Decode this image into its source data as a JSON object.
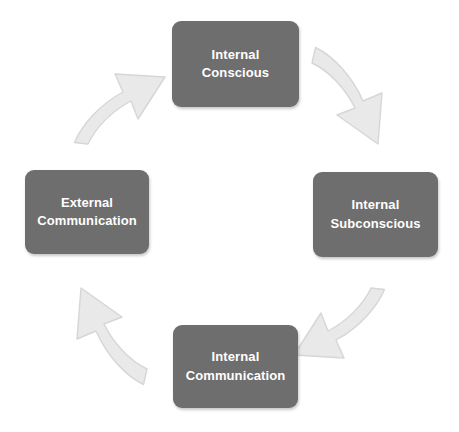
{
  "diagram": {
    "type": "cycle",
    "title": "",
    "background_color": "#ffffff",
    "node_fill_color": "#6e6e6e",
    "node_text_color": "#ffffff",
    "arrow_fill_color": "#e9e9e9",
    "arrow_outline_color": "#d2d2d2",
    "nodes": [
      {
        "id": "internal-conscious",
        "label": "Internal\nConscious",
        "line1": "Internal",
        "line2": "Conscious",
        "position": "top"
      },
      {
        "id": "internal-subconscious",
        "label": "Internal\nSubconscious",
        "line1": "Internal",
        "line2": "Subconscious",
        "position": "right"
      },
      {
        "id": "internal-communication",
        "label": "Internal\nCommunication",
        "line1": "Internal",
        "line2": "Communication",
        "position": "bottom"
      },
      {
        "id": "external-communication",
        "label": "External\nCommunication",
        "line1": "External",
        "line2": "Communication",
        "position": "left"
      }
    ],
    "arrows": [
      {
        "id": "arrow-top-to-right",
        "from": "internal-conscious",
        "to": "internal-subconscious",
        "direction": "down-right"
      },
      {
        "id": "arrow-right-to-bottom",
        "from": "internal-subconscious",
        "to": "internal-communication",
        "direction": "down-left"
      },
      {
        "id": "arrow-bottom-to-left",
        "from": "internal-communication",
        "to": "external-communication",
        "direction": "up-left"
      },
      {
        "id": "arrow-left-to-top",
        "from": "external-communication",
        "to": "internal-conscious",
        "direction": "up-right"
      }
    ]
  }
}
